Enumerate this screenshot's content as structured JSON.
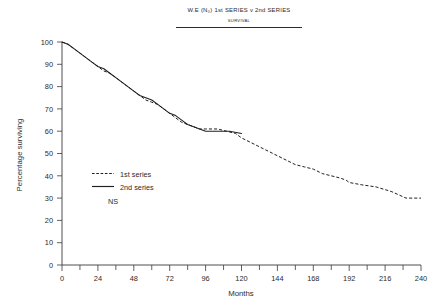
{
  "chart_data": {
    "type": "line",
    "title": "W.E (N₀) 1st SERIES v 2nd SERIES",
    "subtitle": "SURVIVAL",
    "xlabel": "Months",
    "ylabel": "Percentage surviving",
    "xlim": [
      0,
      240
    ],
    "ylim": [
      0,
      100
    ],
    "grid": false,
    "legend_position": "center-left",
    "x_ticks": [
      0,
      24,
      48,
      72,
      96,
      120,
      144,
      168,
      192,
      216,
      240
    ],
    "x_tick_labels": [
      "0",
      "24",
      "48",
      "72",
      "96",
      "120",
      "144",
      "168",
      "192",
      "216",
      "240"
    ],
    "x_minor_tick_interval": 12,
    "y_ticks": [
      0,
      10,
      20,
      30,
      40,
      50,
      60,
      70,
      80,
      90,
      100
    ],
    "y_tick_labels": [
      "0",
      "10",
      "20",
      "30",
      "40",
      "50",
      "60",
      "70",
      "80",
      "90",
      "100"
    ],
    "annotations": [
      "NS"
    ],
    "series": [
      {
        "name": "1st series",
        "style": "dashed",
        "color": "#1f1f1f",
        "x": [
          0,
          4,
          8,
          12,
          16,
          20,
          24,
          28,
          32,
          36,
          40,
          44,
          48,
          52,
          56,
          60,
          64,
          68,
          72,
          76,
          80,
          84,
          88,
          92,
          96,
          104,
          110,
          116,
          120,
          126,
          132,
          138,
          144,
          150,
          156,
          162,
          168,
          174,
          180,
          186,
          190,
          192,
          200,
          210,
          220,
          230,
          240
        ],
        "values": [
          100,
          99,
          97,
          95,
          93,
          91,
          89,
          87,
          86,
          84,
          82,
          80,
          78,
          76,
          74,
          73,
          72,
          70,
          68,
          66,
          64,
          63,
          62,
          61,
          61,
          61,
          60,
          59,
          57,
          55,
          53,
          51,
          49,
          47,
          45,
          44,
          43,
          41,
          40,
          39,
          38,
          37,
          36,
          35,
          33,
          30,
          30
        ]
      },
      {
        "name": "2nd series",
        "style": "solid",
        "color": "#1f1f1f",
        "x": [
          0,
          4,
          8,
          12,
          16,
          20,
          24,
          28,
          32,
          36,
          40,
          44,
          48,
          52,
          56,
          60,
          64,
          68,
          72,
          76,
          80,
          84,
          88,
          92,
          96,
          104,
          112,
          120
        ],
        "values": [
          100,
          99,
          97,
          95,
          93,
          91,
          89,
          88,
          86,
          84,
          82,
          80,
          78,
          76,
          75,
          74,
          72,
          70,
          68,
          67,
          65,
          63,
          62,
          61,
          60,
          60,
          60,
          59
        ]
      }
    ]
  },
  "legend": {
    "items": [
      {
        "label": "1st series",
        "style": "dashed"
      },
      {
        "label": "2nd series",
        "style": "solid"
      }
    ],
    "note": "NS"
  }
}
